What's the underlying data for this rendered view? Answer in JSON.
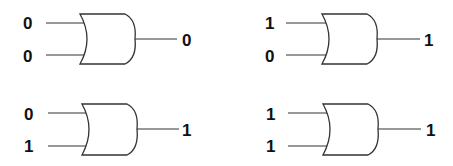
{
  "diagram": {
    "type": "OR gate truth table",
    "gates": [
      {
        "id": "gate-1",
        "inputs": [
          "0",
          "0"
        ],
        "output": "0"
      },
      {
        "id": "gate-2",
        "inputs": [
          "1",
          "0"
        ],
        "output": "1"
      },
      {
        "id": "gate-3",
        "inputs": [
          "0",
          "1"
        ],
        "output": "1"
      },
      {
        "id": "gate-4",
        "inputs": [
          "1",
          "1"
        ],
        "output": "1"
      }
    ]
  }
}
